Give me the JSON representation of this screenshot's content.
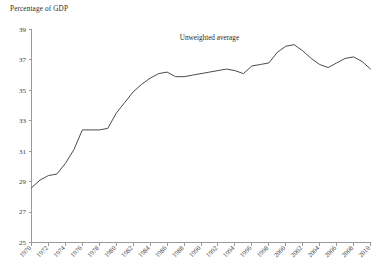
{
  "chart_data": {
    "type": "line",
    "title": "Percentage of GDP",
    "xlabel": "",
    "ylabel": "Percentage of GDP",
    "ylim": [
      25,
      39
    ],
    "xlim": [
      1970,
      2010
    ],
    "grid": false,
    "legend": "none",
    "annotations": [
      {
        "text": "Unweighted average",
        "x": 1991,
        "y": 38.3
      }
    ],
    "yticks": [
      25,
      27,
      29,
      31,
      33,
      35,
      37,
      39
    ],
    "ytick_labels": [
      "25",
      "27",
      "29",
      "31",
      "33",
      "35",
      "37",
      "39"
    ],
    "xticks": [
      1970,
      1972,
      1974,
      1976,
      1978,
      1980,
      1982,
      1984,
      1986,
      1988,
      1990,
      1992,
      1994,
      1996,
      1998,
      2000,
      2002,
      2004,
      2006,
      2008,
      2010
    ],
    "xtick_labels": [
      "1970",
      "1972",
      "1974",
      "1976",
      "1978",
      "1980",
      "1982",
      "1984",
      "1986",
      "1988",
      "1990",
      "1992",
      "1994",
      "1996",
      "1998",
      "2000",
      "2002",
      "2004",
      "2006",
      "2008",
      "2010"
    ],
    "series": [
      {
        "name": "Unweighted average",
        "color": "#4c4c4c",
        "x": [
          1970,
          1971,
          1972,
          1973,
          1974,
          1975,
          1976,
          1977,
          1978,
          1979,
          1980,
          1981,
          1982,
          1983,
          1984,
          1985,
          1986,
          1987,
          1988,
          1989,
          1990,
          1991,
          1992,
          1993,
          1994,
          1995,
          1996,
          1997,
          1998,
          1999,
          2000,
          2001,
          2002,
          2003,
          2004,
          2005,
          2006,
          2007,
          2008,
          2009,
          2010
        ],
        "values": [
          28.6,
          29.1,
          29.4,
          29.5,
          30.2,
          31.1,
          32.4,
          32.4,
          32.4,
          32.5,
          33.5,
          34.2,
          34.9,
          35.4,
          35.8,
          36.1,
          36.2,
          35.9,
          35.9,
          36.0,
          36.1,
          36.2,
          36.3,
          36.4,
          36.3,
          36.1,
          36.6,
          36.7,
          36.8,
          37.5,
          37.9,
          38.0,
          37.6,
          37.1,
          36.7,
          36.5,
          36.8,
          37.1,
          37.2,
          36.9,
          36.4
        ]
      }
    ],
    "colors": {
      "line": "#4c4c4c",
      "axis": "#9a9a9a",
      "text": "#3a3a3a",
      "background": "#ffffff"
    }
  }
}
